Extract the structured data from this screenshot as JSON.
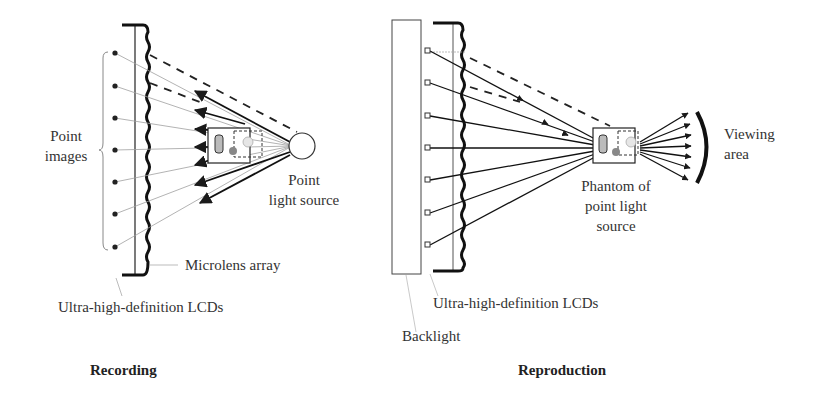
{
  "panels": {
    "recording": {
      "caption": "Recording",
      "labels": {
        "point_images_line1": "Point",
        "point_images_line2": "images",
        "point_light_source_line1": "Point",
        "point_light_source_line2": "light source",
        "microlens_array": "Microlens array",
        "lcds": "Ultra-high-definition LCDs"
      },
      "point_count": 7
    },
    "reproduction": {
      "caption": "Reproduction",
      "labels": {
        "phantom_line1": "Phantom of",
        "phantom_line2": "point light",
        "phantom_line3": "source",
        "viewing_area_line1": "Viewing",
        "viewing_area_line2": "area",
        "lcds": "Ultra-high-definition LCDs",
        "backlight": "Backlight"
      },
      "point_count": 7
    }
  },
  "colors": {
    "ink": "#222222",
    "faint_ray": "#9a9a9a",
    "label_text": "#333333"
  }
}
